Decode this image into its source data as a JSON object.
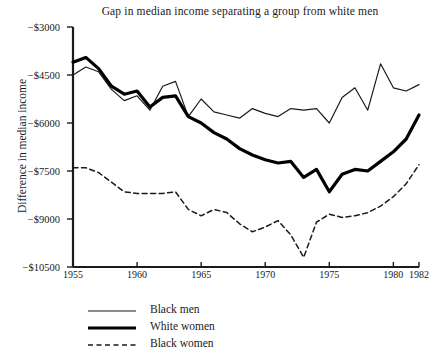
{
  "chart_data": {
    "type": "line",
    "title": "Gap in median income separating a group from white men",
    "xlabel": "",
    "ylabel": "Difference in median income",
    "xlim": [
      1955,
      1982
    ],
    "ylim": [
      -10500,
      -3000
    ],
    "grid": false,
    "legend_position": "below-left",
    "x_ticks": [
      "1955",
      "1960",
      "1965",
      "1970",
      "1975",
      "1980",
      "1982"
    ],
    "x_tick_values": [
      1955,
      1960,
      1965,
      1970,
      1975,
      1980,
      1982
    ],
    "y_ticks": [
      "−$3000",
      "−$4500",
      "−$6000",
      "−$7500",
      "−$9000",
      "−$10500"
    ],
    "y_tick_values": [
      -3000,
      -4500,
      -6000,
      -7500,
      -9000,
      -10500
    ],
    "x": [
      1955,
      1956,
      1957,
      1958,
      1959,
      1960,
      1961,
      1962,
      1963,
      1964,
      1965,
      1966,
      1967,
      1968,
      1969,
      1970,
      1971,
      1972,
      1973,
      1974,
      1975,
      1976,
      1977,
      1978,
      1979,
      1980,
      1981,
      1982
    ],
    "series": [
      {
        "name": "Black men",
        "style": "thin-solid",
        "color": "#1a1a1a",
        "values": [
          -4500,
          -4250,
          -4400,
          -4950,
          -5300,
          -5150,
          -5600,
          -4850,
          -4700,
          -5800,
          -5250,
          -5650,
          -5750,
          -5850,
          -5550,
          -5700,
          -5800,
          -5550,
          -5600,
          -5550,
          -6000,
          -5200,
          -4900,
          -5600,
          -4150,
          -4900,
          -5000,
          -4800
        ]
      },
      {
        "name": "White women",
        "style": "thick-solid",
        "color": "#000000",
        "values": [
          -4100,
          -3950,
          -4300,
          -4850,
          -5100,
          -5000,
          -5500,
          -5200,
          -5150,
          -5800,
          -6000,
          -6300,
          -6500,
          -6800,
          -7000,
          -7150,
          -7250,
          -7200,
          -7700,
          -7450,
          -8150,
          -7600,
          -7450,
          -7500,
          -7200,
          -6900,
          -6500,
          -5750
        ]
      },
      {
        "name": "Black women",
        "style": "dashed",
        "color": "#1a1a1a",
        "values": [
          -7400,
          -7400,
          -7550,
          -7850,
          -8150,
          -8200,
          -8200,
          -8200,
          -8150,
          -8700,
          -8900,
          -8700,
          -8800,
          -9150,
          -9400,
          -9250,
          -9050,
          -9500,
          -10200,
          -9100,
          -8850,
          -8950,
          -8900,
          -8800,
          -8600,
          -8300,
          -7900,
          -7300
        ]
      }
    ]
  },
  "legend": {
    "items": [
      {
        "label": "Black men",
        "style": "thin-solid"
      },
      {
        "label": "White women",
        "style": "thick-solid"
      },
      {
        "label": "Black women",
        "style": "dashed"
      }
    ]
  }
}
